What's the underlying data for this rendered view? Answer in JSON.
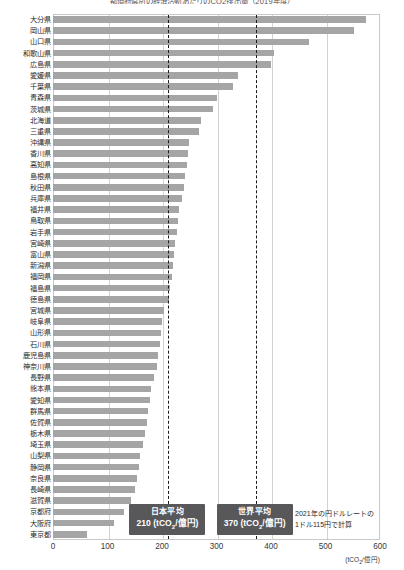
{
  "chart_data": {
    "type": "bar",
    "orientation": "horizontal",
    "title": "都道府県別の経済活動あたりのCO2排出量（2019年度）",
    "xlabel": "(tCO2/億円)",
    "ylabel": "",
    "xlim": [
      0,
      600
    ],
    "xticks": [
      0,
      100,
      200,
      300,
      400,
      500,
      600
    ],
    "grid": true,
    "legend": "none",
    "bar_color": "#a5a5a5",
    "categories": [
      "大分県",
      "岡山県",
      "山口県",
      "和歌山県",
      "広島県",
      "愛媛県",
      "千葉県",
      "青森県",
      "茨城県",
      "北海道",
      "三重県",
      "沖縄県",
      "香川県",
      "高知県",
      "島根県",
      "秋田県",
      "兵庫県",
      "福井県",
      "鳥取県",
      "岩手県",
      "宮崎県",
      "富山県",
      "新潟県",
      "福岡県",
      "福島県",
      "徳島県",
      "宮城県",
      "岐阜県",
      "山形県",
      "石川県",
      "鹿児島県",
      "神奈川県",
      "長野県",
      "熊本県",
      "愛知県",
      "群馬県",
      "佐賀県",
      "栃木県",
      "埼玉県",
      "山梨県",
      "静岡県",
      "奈良県",
      "長崎県",
      "滋賀県",
      "京都府",
      "大阪府",
      "東京都"
    ],
    "values": [
      575,
      552,
      470,
      405,
      400,
      340,
      330,
      300,
      293,
      272,
      268,
      250,
      248,
      245,
      243,
      240,
      237,
      232,
      230,
      228,
      224,
      222,
      220,
      218,
      215,
      212,
      203,
      200,
      198,
      196,
      193,
      190,
      186,
      180,
      178,
      175,
      172,
      168,
      165,
      160,
      158,
      155,
      150,
      143,
      130,
      112,
      62
    ],
    "reference_lines": [
      {
        "id": "japan-average",
        "label": "日本平均",
        "value": 210,
        "unit": "(tCO2/億円)",
        "value_text": "210",
        "style": "dashed"
      },
      {
        "id": "world-average",
        "label": "世界平均",
        "value": 370,
        "unit": "(tCO2/億円)",
        "value_text": "370",
        "style": "dashed"
      }
    ],
    "annotations": [
      {
        "id": "rate-note",
        "line1": "2021年の円ドルレートの",
        "line2": "1ドル115円で計算"
      }
    ]
  }
}
